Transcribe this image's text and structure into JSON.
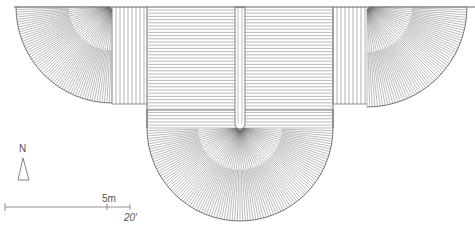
{
  "drawing": {
    "type": "architectural floor plan",
    "stroke_color": "#555555",
    "background": "#ffffff"
  },
  "north_arrow": {
    "label": "N"
  },
  "scale_bar": {
    "metric_label": "5m",
    "imperial_label": "20'"
  }
}
